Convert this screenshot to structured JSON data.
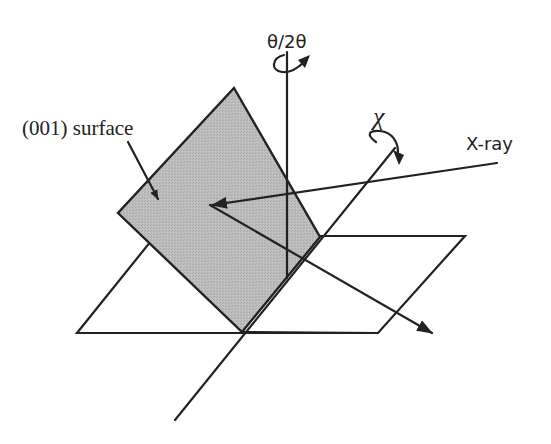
{
  "diagram": {
    "labels": {
      "theta_axis": "θ/2θ",
      "chi_axis": "χ",
      "xray": "X-ray",
      "surface": "(001) surface"
    },
    "colors": {
      "surface_fill": "#b9b9b9",
      "line": "#222222",
      "background": "#ffffff"
    }
  }
}
